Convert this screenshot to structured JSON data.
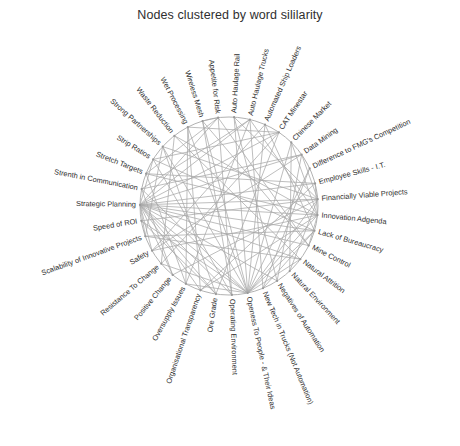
{
  "chart_data": {
    "type": "network",
    "title": "Nodes clustered by word sililarity",
    "layout": "circular",
    "grid": false,
    "legend": "none",
    "xlabel": "",
    "ylabel": "",
    "center": [
      229,
      206
    ],
    "radius": 89,
    "node_count": 33,
    "start_angle_deg": -97,
    "direction": "clockwise",
    "edge_color": "#a9a9a9",
    "node_color": "#9a9a9a",
    "ring_color": "#a9a9a9",
    "label_color": "#2e2e2e",
    "categories": [
      "Appetite for Risk",
      "Auto Haulage Rail",
      "Auto Haulage Trucks",
      "Automated Ship Loaders",
      "CAT Minestar",
      "Chinese Market",
      "Data Mining",
      "Difference to FMG's Competition",
      "Employee Skills - I.T.",
      "Financially Viable Projects",
      "Innovation Adgenda",
      "Lack of Bureaucracy",
      "Mine Control",
      "Natural Attrition",
      "Natural Environment",
      "Negatives of Automation",
      "New Tech in Trucks (Not Automation)",
      "Openess To People - & Their Ideas",
      "Operating Environment",
      "Ore Grade",
      "Organisational Transparency",
      "Oversupply Issues",
      "Positive Change",
      "Resistance To Change",
      "Safety",
      "Scalability of Innovative Projects",
      "Speed of ROI",
      "Strategic Planning",
      "Strenth in Communication",
      "Stretch Targets",
      "Strip Ratios",
      "Strong Partnerships",
      "Waste Reduction",
      "Wet Processing",
      "Wireless Mesh"
    ],
    "edges": [
      [
        27,
        0
      ],
      [
        27,
        2
      ],
      [
        27,
        4
      ],
      [
        27,
        6
      ],
      [
        27,
        8
      ],
      [
        27,
        9
      ],
      [
        27,
        10
      ],
      [
        27,
        11
      ],
      [
        27,
        12
      ],
      [
        27,
        13
      ],
      [
        27,
        15
      ],
      [
        27,
        17
      ],
      [
        27,
        18
      ],
      [
        27,
        19
      ],
      [
        27,
        20
      ],
      [
        27,
        22
      ],
      [
        27,
        24
      ],
      [
        27,
        25
      ],
      [
        27,
        30
      ],
      [
        17,
        1
      ],
      [
        17,
        3
      ],
      [
        17,
        5
      ],
      [
        17,
        7
      ],
      [
        17,
        9
      ],
      [
        17,
        10
      ],
      [
        17,
        11
      ],
      [
        17,
        13
      ],
      [
        17,
        21
      ],
      [
        17,
        23
      ],
      [
        17,
        26
      ],
      [
        17,
        28
      ],
      [
        17,
        31
      ],
      [
        17,
        33
      ],
      [
        17,
        34
      ],
      [
        10,
        2
      ],
      [
        10,
        5
      ],
      [
        10,
        8
      ],
      [
        10,
        12
      ],
      [
        10,
        20
      ],
      [
        10,
        24
      ],
      [
        10,
        29
      ],
      [
        10,
        32
      ],
      [
        9,
        1
      ],
      [
        9,
        6
      ],
      [
        9,
        14
      ],
      [
        9,
        22
      ],
      [
        9,
        26
      ],
      [
        9,
        31
      ],
      [
        11,
        3
      ],
      [
        11,
        16
      ],
      [
        11,
        25
      ],
      [
        11,
        30
      ],
      [
        2,
        16
      ],
      [
        2,
        21
      ],
      [
        2,
        28
      ],
      [
        4,
        19
      ],
      [
        4,
        23
      ],
      [
        4,
        33
      ],
      [
        0,
        12
      ],
      [
        0,
        18
      ],
      [
        0,
        34
      ],
      [
        6,
        15
      ],
      [
        6,
        24
      ],
      [
        8,
        20
      ],
      [
        8,
        29
      ],
      [
        13,
        25
      ],
      [
        13,
        32
      ],
      [
        18,
        30
      ],
      [
        18,
        34
      ],
      [
        19,
        26
      ],
      [
        19,
        31
      ],
      [
        21,
        29
      ],
      [
        21,
        33
      ],
      [
        22,
        28
      ],
      [
        23,
        32
      ],
      [
        5,
        14
      ],
      [
        7,
        16
      ],
      [
        1,
        15
      ],
      [
        3,
        24
      ],
      [
        12,
        34
      ],
      [
        20,
        33
      ],
      [
        25,
        31
      ],
      [
        29,
        0
      ],
      [
        30,
        4
      ],
      [
        28,
        6
      ]
    ]
  }
}
